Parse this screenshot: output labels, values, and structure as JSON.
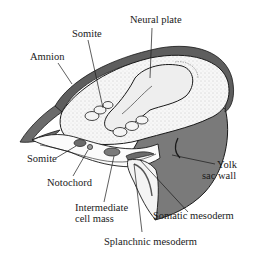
{
  "figure": {
    "labels": {
      "neural_plate": "Neural plate",
      "somite_top": "Somite",
      "amnion": "Amnion",
      "somite_left": "Somite",
      "notochord": "Notochord",
      "intermediate_line1": "Intermediate",
      "intermediate_line2": "cell mass",
      "yolk_line1": "Yolk",
      "yolk_line2": "sac wall",
      "somatic_mesoderm": "Somatic mesoderm",
      "splanchnic_mesoderm": "Splanchnic mesoderm"
    },
    "colors": {
      "ink": "#1a1a1a",
      "dark_fill": "#6b6b6b",
      "mid_fill": "#8a8a8a",
      "light_fill": "#f2f2f2",
      "stipple": "#d9d9d9"
    }
  }
}
